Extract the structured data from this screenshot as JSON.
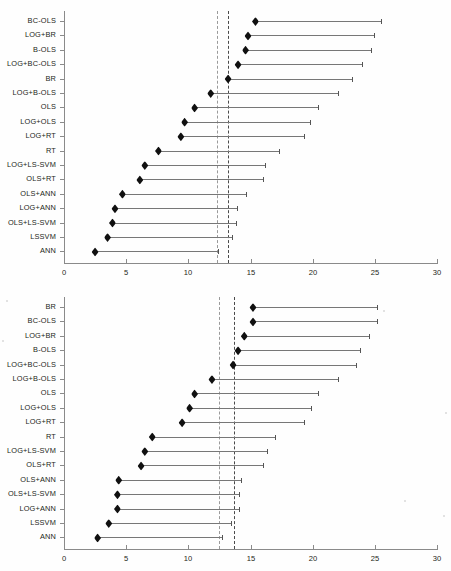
{
  "figure": {
    "title": "",
    "background_color": "#ffffff",
    "marker_color": "#101010",
    "line_color": "#777777",
    "axis_color": "#8a8a8a",
    "reference_line_color": "#9a9a9a"
  },
  "chart_data": [
    {
      "type": "scatter",
      "panel": "top",
      "title": "",
      "xlabel": "",
      "ylabel": "",
      "xlim": [
        0,
        30
      ],
      "xticks": [
        0,
        5,
        10,
        15,
        20,
        25,
        30
      ],
      "xticklabels": [
        "0",
        "5",
        "10",
        "15",
        "20",
        "25",
        "30"
      ],
      "grid": false,
      "legend": "none",
      "orientation": "horizontal",
      "reference_lines": [
        12.3,
        13.2
      ],
      "categories": [
        "BC-OLS",
        "LOG+BR",
        "B-OLS",
        "LOG+BC-OLS",
        "BR",
        "LOG+B-OLS",
        "OLS",
        "LOG+OLS",
        "LOG+RT",
        "RT",
        "LOG+LS-SVM",
        "OLS+RT",
        "OLS+ANN",
        "LOG+ANN",
        "OLS+LS-SVM",
        "LSSVM",
        "ANN"
      ],
      "values": [
        15.4,
        14.8,
        14.6,
        14.0,
        13.2,
        11.8,
        10.5,
        9.7,
        9.4,
        7.6,
        6.5,
        6.1,
        4.7,
        4.1,
        3.9,
        3.5,
        2.5
      ],
      "upper": [
        25.5,
        24.9,
        24.7,
        24.0,
        23.2,
        22.0,
        20.4,
        19.8,
        19.3,
        17.3,
        16.2,
        16.0,
        14.6,
        13.9,
        13.8,
        13.5,
        12.4
      ]
    },
    {
      "type": "scatter",
      "panel": "bottom",
      "title": "",
      "xlabel": "",
      "ylabel": "",
      "xlim": [
        0,
        30
      ],
      "xticks": [
        0,
        5,
        10,
        15,
        20,
        25,
        30
      ],
      "xticklabels": [
        "0",
        "5",
        "10",
        "15",
        "20",
        "25",
        "30"
      ],
      "grid": false,
      "legend": "none",
      "orientation": "horizontal",
      "reference_lines": [
        12.5,
        13.7
      ],
      "categories": [
        "BR",
        "BC-OLS",
        "LOG+BR",
        "B-OLS",
        "LOG+BC-OLS",
        "LOG+B-OLS",
        "OLS",
        "LOG+OLS",
        "LOG+RT",
        "RT",
        "LOG+LS-SVM",
        "OLS+RT",
        "OLS+ANN",
        "OLS+LS-SVM",
        "LOG+ANN",
        "LSSVM",
        "ANN"
      ],
      "values": [
        15.2,
        15.2,
        14.5,
        14.0,
        13.6,
        11.9,
        10.5,
        10.1,
        9.5,
        7.1,
        6.5,
        6.2,
        4.4,
        4.3,
        4.3,
        3.6,
        2.7
      ],
      "upper": [
        25.2,
        25.2,
        24.5,
        23.8,
        23.5,
        22.0,
        20.4,
        19.9,
        19.3,
        17.0,
        16.3,
        16.0,
        14.2,
        14.1,
        14.1,
        13.4,
        12.7
      ]
    }
  ],
  "geometry": {
    "top": {
      "axis_x0": 64,
      "axis_x1": 437,
      "row_first_y": 21,
      "row_step": 14.4,
      "axis_top": 11,
      "axis_bottom": 263,
      "xaxis_y": 263,
      "xlabel_y": 268
    },
    "bottom": {
      "axis_x0": 64,
      "axis_x1": 437,
      "row_first_y": 22,
      "row_step": 14.4,
      "axis_top": 12,
      "axis_bottom": 264,
      "xaxis_y": 264,
      "xlabel_y": 269
    }
  }
}
